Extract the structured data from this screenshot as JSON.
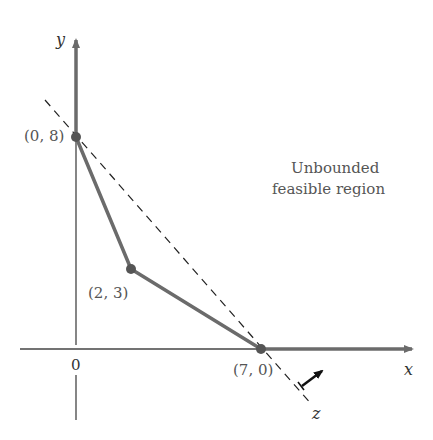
{
  "diagram": {
    "type": "linear-programming-feasible-region",
    "axes": {
      "x_label": "x",
      "y_label": "y",
      "origin_label": "0"
    },
    "vertices": [
      {
        "label": "(0, 8)",
        "x": 0,
        "y": 8
      },
      {
        "label": "(2, 3)",
        "x": 2,
        "y": 3
      },
      {
        "label": "(7, 0)",
        "x": 7,
        "y": 0
      }
    ],
    "region_label_line1": "Unbounded",
    "region_label_line2": "feasible region",
    "objective_line_label": "z",
    "colors": {
      "boundary": "#6b6b6b",
      "axis": "#444444",
      "dashed": "#222222",
      "text": "#555555"
    }
  }
}
